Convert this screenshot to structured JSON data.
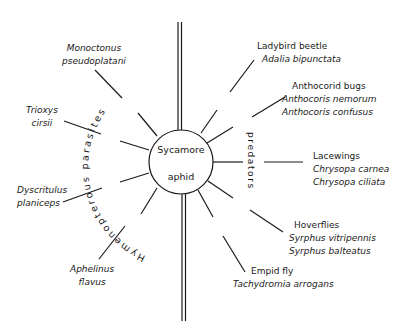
{
  "center": {
    "line1": "Sycamore",
    "line2": "aphid"
  },
  "groups": {
    "parasites": "Hymenopterous parasites",
    "predators": "predators"
  },
  "parasites": [
    {
      "name": "Monoctonus",
      "name2": "pseudoplatani"
    },
    {
      "name": "Trioxys",
      "name2": "cirsii"
    },
    {
      "name": "Dyscritulus",
      "name2": "planiceps"
    },
    {
      "name": "Aphelinus",
      "name2": "flavus"
    }
  ],
  "predators": [
    {
      "common": "Ladybird beetle",
      "species": [
        "Adalia bipunctata"
      ]
    },
    {
      "common": "Anthocorid bugs",
      "species": [
        "Anthocoris nemorum",
        "Anthocoris confusus"
      ]
    },
    {
      "common": "Lacewings",
      "species": [
        "Chrysopa carnea",
        "Chrysopa ciliata"
      ]
    },
    {
      "common": "Hoverflies",
      "species": [
        "Syrphus vitripennis",
        "Syrphus balteatus"
      ]
    },
    {
      "common": "Empid fly",
      "species": [
        "Tachydromia arrogans"
      ]
    }
  ],
  "colors": {
    "ink": "#1a1a1a",
    "background": "#ffffff"
  }
}
